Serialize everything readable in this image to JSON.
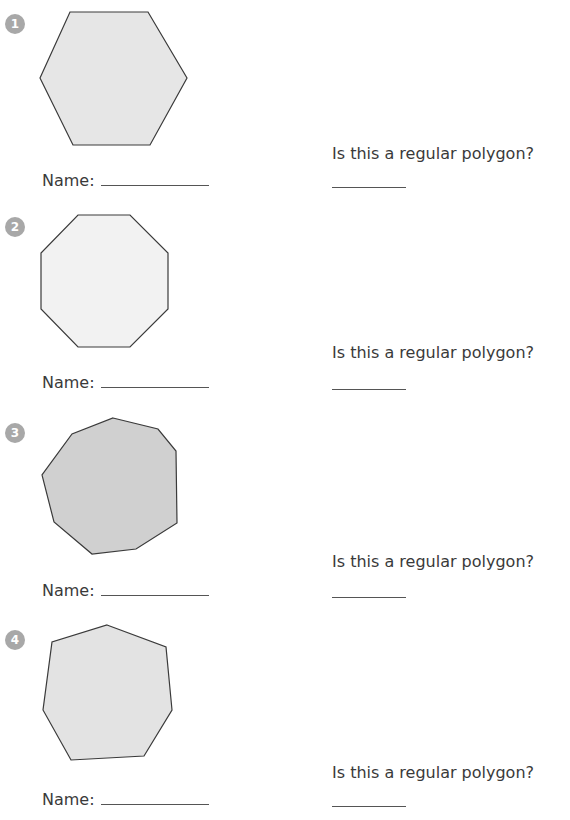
{
  "worksheet": {
    "items": [
      {
        "number": "1",
        "shape": "hexagon",
        "fill": "#e6e6e6",
        "points": "70,12 148,12 187,78 150,145 73,145 40,78",
        "name_label": "Name:",
        "name_value": "",
        "question": "Is this a regular polygon?",
        "answer_value": ""
      },
      {
        "number": "2",
        "shape": "octagon",
        "fill": "#f2f2f2",
        "points": "78,215 130,215 168,253 168,309 130,347 78,347 41,309 41,253",
        "name_label": "Name:",
        "name_value": "",
        "question": "Is this a regular polygon?",
        "answer_value": ""
      },
      {
        "number": "3",
        "shape": "nonagon (irregular)",
        "fill": "#d0d0d0",
        "points": "113,418 158,429 176,451 177,523 136,549 92,554 54,522 42,475 72,434",
        "name_label": "Name:",
        "name_value": "",
        "question": "Is this a regular polygon?",
        "answer_value": ""
      },
      {
        "number": "4",
        "shape": "heptagon (irregular)",
        "fill": "#e3e3e3",
        "points": "107,625 166,647 172,710 144,756 71,760 43,710 52,642",
        "name_label": "Name:",
        "name_value": "",
        "question": "Is this a regular polygon?",
        "answer_value": ""
      }
    ]
  },
  "colors": {
    "badge": "#a8a8a8",
    "stroke": "#3a3a3a",
    "text": "#3a3a3a"
  }
}
